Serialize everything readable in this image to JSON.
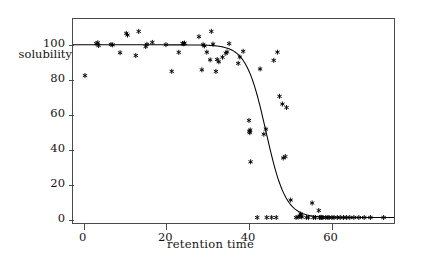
{
  "chart_data": {
    "type": "scatter",
    "title": "",
    "xlabel": "retention time",
    "ylabel": "solubility",
    "xlim": [
      -2.6,
      75.6
    ],
    "ylim": [
      -3,
      115
    ],
    "xticks": [
      0,
      20,
      40,
      60
    ],
    "yticks": [
      0,
      20,
      40,
      60,
      80,
      100
    ],
    "grid": false,
    "legend": null,
    "series": [
      {
        "name": "observations",
        "type": "scatter",
        "marker": "asterisk",
        "color": "#000000",
        "points": [
          [
            0.3,
            82.6
          ],
          [
            3.0,
            100.9
          ],
          [
            3.4,
            101.4
          ],
          [
            3.6,
            99.8
          ],
          [
            6.6,
            100.4
          ],
          [
            7.0,
            100.2
          ],
          [
            8.8,
            95.7
          ],
          [
            10.3,
            106.8
          ],
          [
            10.6,
            105.8
          ],
          [
            12.6,
            94.1
          ],
          [
            13.3,
            107.9
          ],
          [
            15.0,
            99.2
          ],
          [
            15.3,
            100.5
          ],
          [
            16.6,
            101.6
          ],
          [
            19.9,
            100.3
          ],
          [
            21.3,
            85.0
          ],
          [
            23.0,
            95.9
          ],
          [
            23.9,
            101.0
          ],
          [
            24.2,
            100.8
          ],
          [
            24.4,
            101.2
          ],
          [
            27.9,
            104.9
          ],
          [
            28.6,
            85.9
          ],
          [
            28.9,
            100.3
          ],
          [
            29.2,
            99.6
          ],
          [
            29.8,
            96.0
          ],
          [
            30.6,
            91.6
          ],
          [
            30.9,
            107.9
          ],
          [
            31.3,
            100.6
          ],
          [
            32.0,
            85.0
          ],
          [
            32.3,
            91.8
          ],
          [
            32.7,
            90.5
          ],
          [
            33.6,
            93.1
          ],
          [
            34.4,
            95.4
          ],
          [
            34.7,
            96.1
          ],
          [
            35.2,
            100.9
          ],
          [
            37.4,
            89.6
          ],
          [
            37.8,
            93.2
          ],
          [
            38.6,
            96.5
          ],
          [
            40.0,
            56.9
          ],
          [
            40.1,
            50.7
          ],
          [
            40.2,
            49.9
          ],
          [
            40.3,
            51.4
          ],
          [
            40.4,
            33.2
          ],
          [
            42.0,
            1.3
          ],
          [
            42.7,
            86.4
          ],
          [
            43.6,
            49.0
          ],
          [
            44.1,
            51.9
          ],
          [
            44.3,
            1.3
          ],
          [
            45.5,
            1.3
          ],
          [
            46.0,
            91.3
          ],
          [
            46.6,
            1.3
          ],
          [
            46.9,
            96.0
          ],
          [
            47.4,
            70.7
          ],
          [
            48.1,
            66.3
          ],
          [
            48.3,
            35.4
          ],
          [
            48.8,
            36.2
          ],
          [
            49.1,
            64.3
          ],
          [
            50.1,
            11.3
          ],
          [
            51.4,
            1.3
          ],
          [
            51.9,
            1.5
          ],
          [
            52.3,
            2.0
          ],
          [
            52.5,
            3.3
          ],
          [
            52.6,
            2.2
          ],
          [
            52.8,
            1.6
          ],
          [
            53.9,
            1.3
          ],
          [
            54.4,
            1.3
          ],
          [
            55.3,
            9.6
          ],
          [
            55.6,
            1.3
          ],
          [
            56.1,
            1.3
          ],
          [
            56.9,
            5.3
          ],
          [
            57.1,
            1.3
          ],
          [
            57.4,
            1.4
          ],
          [
            57.6,
            1.3
          ],
          [
            57.9,
            1.3
          ],
          [
            58.6,
            1.3
          ],
          [
            59.1,
            1.3
          ],
          [
            59.4,
            1.3
          ],
          [
            60.1,
            1.3
          ],
          [
            60.6,
            1.3
          ],
          [
            61.4,
            1.3
          ],
          [
            62.1,
            1.3
          ],
          [
            62.9,
            1.3
          ],
          [
            63.6,
            1.3
          ],
          [
            64.4,
            1.3
          ],
          [
            65.4,
            1.3
          ],
          [
            66.6,
            1.3
          ],
          [
            67.9,
            1.3
          ],
          [
            69.4,
            1.3
          ],
          [
            72.6,
            1.3
          ]
        ]
      },
      {
        "name": "fitted sigmoid",
        "type": "line",
        "color": "#000000",
        "model": "logistic",
        "params": {
          "upper": 100.2,
          "lower": 1.3,
          "midpoint": 44.1,
          "slope": 0.42
        }
      }
    ]
  },
  "axes": {
    "y_title": "solubility",
    "x_title": "retention time",
    "x_tick_labels": [
      "0",
      "20",
      "40",
      "60"
    ],
    "y_tick_labels": [
      "0",
      "20",
      "40",
      "60",
      "80",
      "100"
    ]
  },
  "style": {
    "frame_color": "#4a4a4a",
    "ink_color": "#000000",
    "background": "#ffffff"
  }
}
